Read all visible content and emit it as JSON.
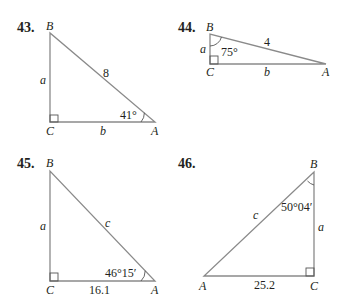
{
  "problems": [
    {
      "number": "43.",
      "vertices": {
        "B": "B",
        "C": "C",
        "A": "A"
      },
      "sides": {
        "a": "a",
        "b": "b",
        "c": "8"
      },
      "angle": {
        "at": "A",
        "label": "41°"
      },
      "right_angle_at": "C"
    },
    {
      "number": "44.",
      "vertices": {
        "B": "B",
        "C": "C",
        "A": "A"
      },
      "sides": {
        "a": "a",
        "b": "b",
        "c": "4"
      },
      "angle": {
        "at": "B",
        "label": "75°"
      },
      "right_angle_at": "C"
    },
    {
      "number": "45.",
      "vertices": {
        "B": "B",
        "C": "C",
        "A": "A"
      },
      "sides": {
        "a": "a",
        "b": "16.1",
        "c": "c"
      },
      "angle": {
        "at": "A",
        "label": "46°15′"
      },
      "right_angle_at": "C"
    },
    {
      "number": "46.",
      "vertices": {
        "B": "B",
        "C": "C",
        "A": "A"
      },
      "sides": {
        "a": "a",
        "b": "25.2",
        "c": "c"
      },
      "angle": {
        "at": "B",
        "label": "50°04′"
      },
      "right_angle_at": "C"
    }
  ]
}
